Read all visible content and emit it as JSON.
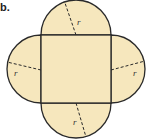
{
  "figure": {
    "label": "b.",
    "shape": "square with four semicircles on each side",
    "fill_color": "#f6e7bd",
    "stroke_color": "#2a2a2a",
    "radius_labels": [
      {
        "side": "top",
        "text": "r"
      },
      {
        "side": "left",
        "text": "r"
      },
      {
        "side": "right",
        "text": "r"
      },
      {
        "side": "bottom",
        "text": "r"
      }
    ]
  }
}
